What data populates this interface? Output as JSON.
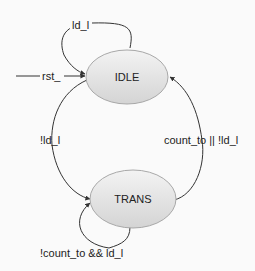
{
  "diagram": {
    "type": "state-machine",
    "states": [
      {
        "id": "idle",
        "label": "IDLE"
      },
      {
        "id": "trans",
        "label": "TRANS"
      }
    ],
    "transitions": [
      {
        "id": "reset",
        "from": null,
        "to": "idle",
        "label": "rst_"
      },
      {
        "id": "idle-self",
        "from": "idle",
        "to": "idle",
        "label": "ld_l"
      },
      {
        "id": "idle-to-trans",
        "from": "idle",
        "to": "trans",
        "label": "!ld_l"
      },
      {
        "id": "trans-to-idle",
        "from": "trans",
        "to": "idle",
        "label": "count_to || !ld_l"
      },
      {
        "id": "trans-self",
        "from": "trans",
        "to": "trans",
        "label": "!count_to && ld_l"
      }
    ],
    "colors": {
      "state_fill_top": "#f2f2f2",
      "state_fill_bottom": "#d6d6d6",
      "state_stroke": "#a8a8a8",
      "edge": "#333333"
    }
  }
}
